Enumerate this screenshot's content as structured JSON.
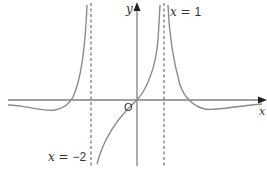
{
  "diagram": {
    "axes": {
      "x_label": "x",
      "y_label": "y",
      "origin_label": "O"
    },
    "asymptotes": [
      {
        "label_var": "x",
        "label_eq": "=",
        "label_val": "1",
        "x_value": 1
      },
      {
        "label_var": "x",
        "label_eq": "=",
        "label_val": "−2",
        "x_value": -2
      }
    ],
    "colors": {
      "curve": "#8a8a8a",
      "axis": "#777777",
      "asymptote": "#555555",
      "text": "#333333"
    }
  }
}
